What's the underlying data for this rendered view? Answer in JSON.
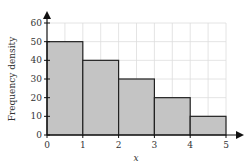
{
  "chart_data": {
    "type": "bar",
    "subtype": "histogram",
    "title": "",
    "xlabel": "x",
    "ylabel": "Frequency density",
    "bins": [
      {
        "x0": 0,
        "x1": 1,
        "value": 50
      },
      {
        "x0": 1,
        "x1": 2,
        "value": 40
      },
      {
        "x0": 2,
        "x1": 3,
        "value": 30
      },
      {
        "x0": 3,
        "x1": 4,
        "value": 20
      },
      {
        "x0": 4,
        "x1": 5,
        "value": 10
      }
    ],
    "categories": [
      "0-1",
      "1-2",
      "2-3",
      "3-4",
      "4-5"
    ],
    "values": [
      50,
      40,
      30,
      20,
      10
    ],
    "xlim": [
      0,
      5
    ],
    "ylim": [
      0,
      60
    ],
    "xticks": [
      "0",
      "1",
      "2",
      "3",
      "4",
      "5"
    ],
    "yticks": [
      "0",
      "10",
      "20",
      "30",
      "40",
      "50",
      "60"
    ],
    "grid": true,
    "legend": null,
    "colors": {
      "bar_fill": "#c4c4c4",
      "bar_stroke": "#222222",
      "grid": "#dddddd",
      "axis": "#111111"
    }
  }
}
